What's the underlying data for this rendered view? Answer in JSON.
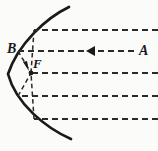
{
  "figure": {
    "background_color": "#fbfbfa",
    "ink_color": "#1a1a1a",
    "width": 158,
    "height": 151
  },
  "labels": {
    "incident_ray": "A",
    "mirror_point": "B",
    "focus": "F"
  },
  "geometry": {
    "mirror": {
      "name": "concave-parabolic-mirror",
      "vertex": [
        8,
        74
      ],
      "top_end": [
        69,
        7
      ],
      "bottom_end": [
        71,
        139
      ],
      "stroke_width": 2.6
    },
    "focus_point": [
      31,
      73
    ],
    "incident_rays": [
      {
        "y": 30,
        "x_start": 157,
        "x_end": 34
      },
      {
        "y": 51,
        "x_start": 135,
        "x_end": 18
      },
      {
        "y": 73,
        "x_start": 157,
        "x_end": 31
      },
      {
        "y": 96,
        "x_start": 157,
        "x_end": 18
      },
      {
        "y": 119,
        "x_start": 157,
        "x_end": 34
      }
    ],
    "reflected_rays": [
      {
        "from": [
          34,
          30
        ],
        "to": [
          31,
          73
        ]
      },
      {
        "from": [
          18,
          51
        ],
        "to": [
          31,
          73
        ]
      },
      {
        "from": [
          18,
          96
        ],
        "to": [
          31,
          73
        ]
      },
      {
        "from": [
          34,
          119
        ],
        "to": [
          31,
          73
        ]
      }
    ],
    "arrows": [
      {
        "name": "incident-direction-arrow",
        "at": [
          92,
          51
        ],
        "direction": "left"
      },
      {
        "name": "reflected-direction-arrow",
        "at": [
          28,
          67
        ],
        "direction": "down-right"
      }
    ],
    "dash_pattern": "6 4"
  }
}
